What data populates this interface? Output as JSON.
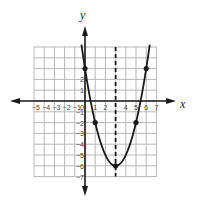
{
  "chart_data": {
    "type": "line",
    "title": "",
    "xlabel": "x",
    "ylabel": "y",
    "function": "y = (x - 3)^2 - 6",
    "xlim": [
      -5,
      7
    ],
    "ylim": [
      -7,
      5
    ],
    "grid": true,
    "x_ticks": [
      "-5",
      "-4",
      "-3",
      "-2",
      "-1",
      "0",
      "1",
      "2",
      "4",
      "5",
      "6",
      "7"
    ],
    "y_ticks": [
      "2",
      "1",
      "-1",
      "-2",
      "-3",
      "-4",
      "-5",
      "-6",
      "-7"
    ],
    "axis_of_symmetry": {
      "x": 3,
      "style": "dashed"
    },
    "points": [
      {
        "x": 0,
        "y": 3
      },
      {
        "x": 1,
        "y": -2
      },
      {
        "x": 3,
        "y": -6
      },
      {
        "x": 5,
        "y": -2
      },
      {
        "x": 6,
        "y": 3
      }
    ],
    "vertex": {
      "x": 3,
      "y": -6
    }
  },
  "labels": {
    "x_axis": "x",
    "y_axis": "y"
  },
  "colors": {
    "grid": "#b8b8b8",
    "curve": "#1a1a1a",
    "axis": "#1a1a1a"
  }
}
